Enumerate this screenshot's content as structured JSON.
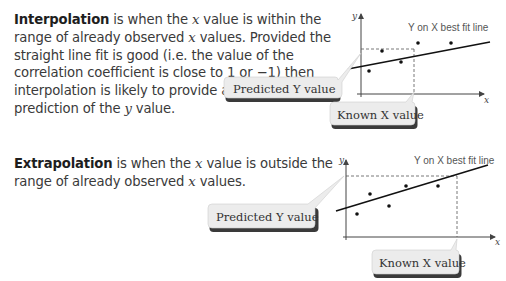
{
  "sections": [
    {
      "id": "interpolation",
      "term": "Interpolation",
      "text_parts": [
        " is when the ",
        "x",
        " value is within the range of already observed ",
        "x",
        " values. Provided the straight line fit is good (i.e. the value of the correlation coefficient is close to 1 or −1) then interpolation is likely to provide a reliable prediction of the ",
        "y",
        " value."
      ],
      "diagram": {
        "fit_line_label": "Y on X best fit line",
        "x_axis_label": "x",
        "y_axis_label": "y",
        "predicted_label": "Predicted Y value",
        "known_label": "Known X value"
      }
    },
    {
      "id": "extrapolation",
      "term": "Extrapolation",
      "text_parts": [
        " is when the ",
        "x",
        " value is outside the range of already observed ",
        "x",
        " values."
      ],
      "diagram": {
        "fit_line_label": "Y on X best fit line",
        "x_axis_label": "x",
        "y_axis_label": "y",
        "predicted_label": "Predicted Y value",
        "known_label": "Known X value"
      }
    }
  ],
  "colors": {
    "callout_fill": "#ececec",
    "callout_shadow": "#3a3a3a",
    "axis": "#444444",
    "points": "#111111",
    "dashed": "#555555"
  }
}
